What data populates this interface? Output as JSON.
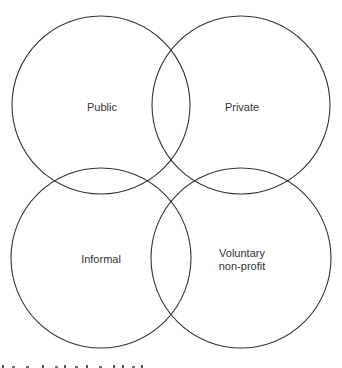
{
  "diagram": {
    "type": "venn-like overlapping circles",
    "circles": [
      {
        "id": "public",
        "label_lines": [
          "Public"
        ],
        "cx": 101,
        "cy": 105,
        "r": 89
      },
      {
        "id": "private",
        "label_lines": [
          "Private"
        ],
        "cx": 241,
        "cy": 105,
        "r": 89
      },
      {
        "id": "informal",
        "label_lines": [
          "Informal"
        ],
        "cx": 101,
        "cy": 258,
        "r": 90
      },
      {
        "id": "voluntary",
        "label_lines": [
          "Voluntary",
          "non-profit"
        ],
        "cx": 241,
        "cy": 258,
        "r": 90
      }
    ],
    "stroke_color": "#333333",
    "background": "#ffffff"
  },
  "labels": {
    "public": "Public",
    "private": "Private",
    "informal": "Informal",
    "voluntary_line1": "Voluntary",
    "voluntary_line2": "non-profit"
  },
  "footer": {
    "caption_fragment": "Figure caption (cut off at bottom edge)"
  }
}
